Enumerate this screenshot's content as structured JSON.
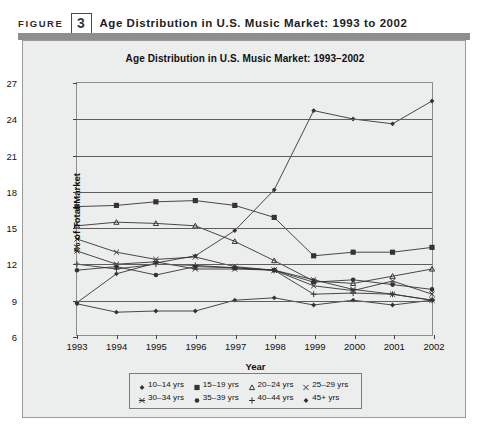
{
  "figure": {
    "label": "FIGURE",
    "number": "3",
    "caption": "Age Distribution in U.S. Music Market: 1993 to 2002"
  },
  "chart_data": {
    "type": "line",
    "title": "Age Distribution in U.S. Music Market: 1993–2002",
    "xlabel": "Year",
    "ylabel": "% of Total Market",
    "categories": [
      "1993",
      "1994",
      "1995",
      "1996",
      "1997",
      "1998",
      "1999",
      "2000",
      "2001",
      "2002"
    ],
    "x": [
      1993,
      1994,
      1995,
      1996,
      1997,
      1998,
      1999,
      2000,
      2001,
      2002
    ],
    "ylim": [
      6,
      27
    ],
    "yticks": [
      6,
      9,
      12,
      15,
      18,
      21,
      24,
      27
    ],
    "grid": true,
    "legend_position": "bottom",
    "series": [
      {
        "name": "10–14 yrs",
        "marker": "diamond",
        "values": [
          8.6,
          7.9,
          8.0,
          8.0,
          8.9,
          9.1,
          8.5,
          8.9,
          8.5,
          8.9
        ]
      },
      {
        "name": "15–19 yrs",
        "marker": "square",
        "values": [
          16.7,
          16.8,
          17.1,
          17.2,
          16.8,
          15.8,
          12.6,
          12.9,
          12.9,
          13.3
        ]
      },
      {
        "name": "20–24 yrs",
        "marker": "triangle",
        "values": [
          15.1,
          15.4,
          15.3,
          15.1,
          13.8,
          12.2,
          10.5,
          10.3,
          10.9,
          11.5
        ]
      },
      {
        "name": "25–29 yrs",
        "marker": "cross",
        "values": [
          14.0,
          12.9,
          12.3,
          12.5,
          11.7,
          11.4,
          10.1,
          9.7,
          10.5,
          9.4
        ]
      },
      {
        "name": "30–34 yrs",
        "marker": "asterisk",
        "values": [
          13.0,
          11.9,
          12.1,
          11.5,
          11.5,
          11.4,
          10.6,
          9.8,
          9.4,
          8.9
        ]
      },
      {
        "name": "35–39 yrs",
        "marker": "dot",
        "values": [
          11.4,
          11.7,
          11.0,
          11.7,
          11.6,
          11.4,
          10.4,
          10.6,
          10.2,
          9.8
        ]
      },
      {
        "name": "40–44 yrs",
        "marker": "plus",
        "values": [
          11.9,
          11.5,
          11.9,
          11.8,
          11.6,
          11.4,
          9.4,
          9.5,
          9.4,
          8.9
        ]
      },
      {
        "name": "45+ yrs",
        "marker": "diamond-filled",
        "values": [
          8.7,
          11.1,
          12.0,
          12.6,
          14.7,
          18.1,
          24.7,
          24.0,
          23.6,
          25.5
        ]
      }
    ]
  },
  "legend": {
    "rows": [
      [
        "10–14 yrs",
        "15–19 yrs",
        "20–24 yrs",
        "25–29 yrs"
      ],
      [
        "30–34 yrs",
        "35–39 yrs",
        "40–44 yrs",
        "45+ yrs"
      ]
    ]
  }
}
